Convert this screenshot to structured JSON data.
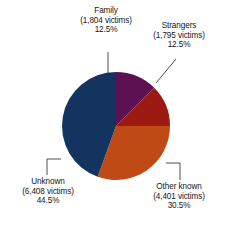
{
  "chart_data": {
    "type": "pie",
    "title": "",
    "subtitle": "",
    "xlabel": "",
    "ylabel": "",
    "legend_position": "none",
    "grid": false,
    "total_victims": 14408,
    "categories": [
      "Family",
      "Strangers",
      "Other known",
      "Unknown"
    ],
    "values": [
      12.5,
      12.5,
      30.5,
      44.5
    ],
    "counts": [
      1804,
      1795,
      4401,
      6408
    ],
    "slices": [
      {
        "name": "Family",
        "label_name": "Family",
        "count_text": "(1,804 victims)",
        "percent_text": "12.5%",
        "count": 1804,
        "percent": 12.5,
        "color": "#5E1152",
        "start_angle": 0,
        "end_angle": 45,
        "leader": "vertical-tick",
        "label_position": "top"
      },
      {
        "name": "Strangers",
        "label_name": "Strangers",
        "count_text": "(1,795 victims)",
        "percent_text": "12.5%",
        "count": 1795,
        "percent": 12.5,
        "color": "#9C1A12",
        "start_angle": 45,
        "end_angle": 90,
        "leader": "diagonal",
        "label_position": "top-right"
      },
      {
        "name": "Other known",
        "label_name": "Other known",
        "count_text": "(4,401 victims)",
        "percent_text": "30.5%",
        "count": 4401,
        "percent": 30.5,
        "color": "#BF4A15",
        "start_angle": 90,
        "end_angle": 199.8,
        "leader": "elbow-right",
        "label_position": "bottom-right"
      },
      {
        "name": "Unknown",
        "label_name": "Unknown",
        "count_text": "(6,408 victims)",
        "percent_text": "44.5%",
        "count": 6408,
        "percent": 44.5,
        "color": "#143460",
        "start_angle": 199.8,
        "end_angle": 360,
        "leader": "elbow-left",
        "label_position": "bottom-left"
      }
    ],
    "colors": {
      "family": "#5E1152",
      "strangers": "#9C1A12",
      "other_known": "#BF4A15",
      "unknown": "#143460",
      "background": "#ffffff",
      "text": "#161616",
      "leader_line": "#3a3a3a"
    }
  }
}
